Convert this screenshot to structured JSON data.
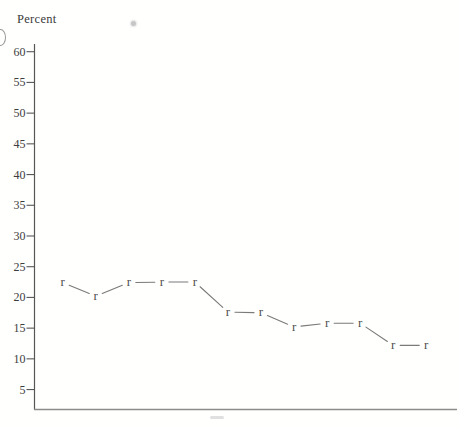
{
  "chart_data": {
    "type": "line",
    "title": "",
    "ylabel": "Percent",
    "xlabel": "",
    "marker_glyph": "r",
    "yticks": [
      60,
      55,
      50,
      45,
      40,
      35,
      30,
      25,
      20,
      15,
      10,
      5
    ],
    "ylim": [
      0,
      62
    ],
    "x": [
      1,
      2,
      3,
      4,
      5,
      6,
      7,
      8,
      9,
      10,
      11,
      12
    ],
    "x_tick_labels": [],
    "values": [
      22.4,
      20.2,
      22.4,
      22.5,
      22.5,
      17.6,
      17.5,
      15.2,
      15.8,
      15.8,
      12.2,
      12.2
    ],
    "grid": false,
    "legend": "none",
    "colors": {
      "axis": "#565656",
      "x_axis": "#8c8c8c",
      "tick_text": "#3d3d3d",
      "line": "#7a7a7a",
      "marker": "#4f4f4f",
      "background": "#fffffe"
    }
  }
}
